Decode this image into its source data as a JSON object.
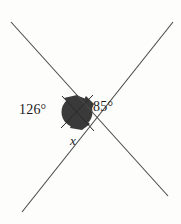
{
  "figure": {
    "type": "intersecting-lines-angle-diagram",
    "background_color": "#fdfdfc",
    "line_color": "#4a4a4a",
    "shade_color": "#3a3a3a",
    "text_color": "#1a1a1a",
    "center": {
      "x": 77,
      "y": 111
    },
    "lines": [
      {
        "name": "line-upper-left-to-lower-right",
        "x1": 11,
        "y1": 22,
        "x2": 168,
        "y2": 196
      },
      {
        "name": "line-upper-right-to-lower-left",
        "x1": 173,
        "y1": 22,
        "x2": 22,
        "y2": 212
      }
    ],
    "shade": {
      "name": "center-shaded-region",
      "cx": 77,
      "cy": 112,
      "r": 16
    },
    "labels": {
      "left_angle": "126°",
      "right_angle": "85°",
      "unknown_angle": "x"
    }
  }
}
